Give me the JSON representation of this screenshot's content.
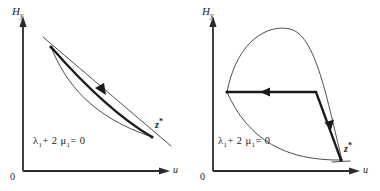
{
  "figure": {
    "background_color": "#ffffff",
    "ink_color": "#1a1a1a",
    "width": 380,
    "height": 191
  },
  "panels": [
    {
      "id": "panel-left",
      "axes": {
        "y_label_main": "H",
        "y_label_sub": "y",
        "x_label": "u",
        "origin_label": "0"
      },
      "annotation": {
        "equation_lhs1": "λ",
        "equation_sub1": "1",
        "equation_mid": "+ 2 μ",
        "equation_sub2": "1",
        "equation_rhs": "= 0",
        "equation_text": "λ₁ + 2 μ₁ = 0"
      },
      "terminal_point": {
        "label_main": "z",
        "label_sup": "*",
        "label_text": "z*"
      },
      "curves": [
        {
          "name": "thin-arc",
          "style": "thin",
          "description": "thin concave arc from upper-left vertex to terminal point z*"
        },
        {
          "name": "thick-trajectory",
          "style": "thick",
          "description": "thick bowed trajectory from z* back to upper-left vertex, arrow pointing up-left"
        },
        {
          "name": "thin-tangent-line",
          "style": "thin",
          "description": "thin straight line crossing both vertices, extending beyond them"
        }
      ],
      "arrows": [
        {
          "name": "trajectory-arrow",
          "direction": "up-left"
        }
      ]
    },
    {
      "id": "panel-right",
      "axes": {
        "y_label_main": "H",
        "y_label_sub": "y",
        "x_label": "u",
        "origin_label": "0"
      },
      "annotation": {
        "equation_lhs1": "λ",
        "equation_sub1": "1",
        "equation_mid": "+ 2 μ",
        "equation_sub2": "1",
        "equation_rhs": "= 0",
        "equation_text": "λ₁ + 2 μ₁ = 0"
      },
      "terminal_point": {
        "label_main": "z",
        "label_sup": "*",
        "label_text": "z*"
      },
      "curves": [
        {
          "name": "thin-upper-arc",
          "style": "thin",
          "description": "large thin arc rising from left vertex over a hump and descending to z*"
        },
        {
          "name": "thin-lower-arc",
          "style": "thin",
          "description": "thin arc sagging from left vertex down and right to z*"
        },
        {
          "name": "thick-horizontal-segment",
          "style": "thick",
          "description": "thick horizontal segment with left-pointing arrow at its midpoint"
        },
        {
          "name": "thick-descending-segment",
          "style": "thick",
          "description": "thick steep segment descending to z* with a down arrow"
        }
      ],
      "arrows": [
        {
          "name": "horizontal-arrow",
          "direction": "left"
        },
        {
          "name": "descending-arrow",
          "direction": "down"
        }
      ]
    }
  ]
}
